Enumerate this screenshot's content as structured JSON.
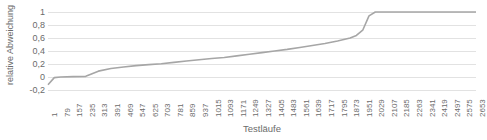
{
  "chart_data": {
    "type": "line",
    "title": "",
    "xlabel": "Testläufe",
    "ylabel": "relative Abweichung",
    "ylim": [
      -0.2,
      1.0
    ],
    "xlim": [
      1,
      2653
    ],
    "grid": true,
    "legend": false,
    "line_color": "#A6A6A6",
    "grid_color": "#E2E2E2",
    "text_color": "#6B6B6B",
    "y_ticks": [
      "1",
      "0,8",
      "0,6",
      "0,4",
      "0,2",
      "0",
      "-0,2"
    ],
    "y_tick_values": [
      1,
      0.8,
      0.6,
      0.4,
      0.2,
      0,
      -0.2
    ],
    "x_ticks": [
      "1",
      "79",
      "157",
      "235",
      "313",
      "391",
      "469",
      "547",
      "625",
      "703",
      "781",
      "859",
      "937",
      "1015",
      "1093",
      "1171",
      "1249",
      "1327",
      "1405",
      "1483",
      "1561",
      "1639",
      "1717",
      "1795",
      "1873",
      "1951",
      "2029",
      "2107",
      "2185",
      "2263",
      "2341",
      "2419",
      "2497",
      "2575",
      "2653"
    ],
    "x": [
      1,
      40,
      79,
      157,
      235,
      274,
      313,
      391,
      469,
      547,
      625,
      703,
      781,
      859,
      937,
      1015,
      1093,
      1171,
      1249,
      1327,
      1405,
      1483,
      1561,
      1639,
      1717,
      1795,
      1873,
      1912,
      1951,
      1990,
      2029,
      2107,
      2185,
      2263,
      2341,
      2419,
      2497,
      2575,
      2653
    ],
    "values": [
      -0.12,
      -0.01,
      0.0,
      0.005,
      0.01,
      0.05,
      0.09,
      0.13,
      0.155,
      0.175,
      0.19,
      0.205,
      0.225,
      0.245,
      0.265,
      0.285,
      0.3,
      0.325,
      0.35,
      0.375,
      0.4,
      0.425,
      0.455,
      0.485,
      0.515,
      0.555,
      0.6,
      0.64,
      0.72,
      0.94,
      1.0,
      1.0,
      1.0,
      1.0,
      1.0,
      1.0,
      1.0,
      1.0,
      1.0
    ],
    "series": [
      {
        "name": "relative Abweichung",
        "values": [
          -0.12,
          -0.01,
          0.0,
          0.005,
          0.01,
          0.05,
          0.09,
          0.13,
          0.155,
          0.175,
          0.19,
          0.205,
          0.225,
          0.245,
          0.265,
          0.285,
          0.3,
          0.325,
          0.35,
          0.375,
          0.4,
          0.425,
          0.455,
          0.485,
          0.515,
          0.555,
          0.6,
          0.64,
          0.72,
          0.94,
          1.0,
          1.0,
          1.0,
          1.0,
          1.0,
          1.0,
          1.0,
          1.0,
          1.0
        ]
      }
    ]
  }
}
